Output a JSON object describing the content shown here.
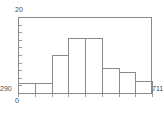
{
  "chart_data": {
    "type": "bar",
    "title": "",
    "xlabel": "",
    "ylabel": "",
    "categories": [
      "290-343",
      "343-396",
      "396-449",
      "449-501",
      "501-554",
      "554-607",
      "607-659",
      "659-711"
    ],
    "values": [
      2.6,
      2.6,
      10.0,
      14.5,
      14.5,
      6.6,
      5.5,
      3.2
    ],
    "bar_tops_px": [
      83,
      83,
      55,
      38,
      38,
      68,
      72,
      81
    ],
    "xlim": [
      290,
      711
    ],
    "ylim": [
      0,
      20
    ],
    "grid": false,
    "legend": null
  },
  "axes": {
    "y_max_label": "20",
    "y_min_label": "290",
    "x_min_label": "0",
    "x_max_label": "711"
  },
  "style": {
    "line_color": "#8a8a8a",
    "text_color": "#4a4a4a",
    "background": "#ffffff"
  }
}
